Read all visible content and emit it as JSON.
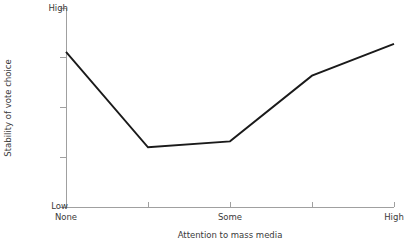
{
  "chart_data": {
    "type": "line",
    "title": "",
    "xlabel": "Attention to mass media",
    "ylabel": "Stability of vote choice",
    "x_tick_labels": [
      "None",
      "",
      "Some",
      "",
      "High"
    ],
    "y_tick_labels": [
      "Low",
      "",
      "",
      "",
      "High"
    ],
    "x_axis_low_label": "None",
    "x_axis_mid_label": "Some",
    "x_axis_high_label": "High",
    "y_axis_low_label": "Low",
    "y_axis_high_label": "High",
    "x_tick_count": 5,
    "y_tick_count": 5,
    "grid": false,
    "legend": null,
    "xlim": [
      0,
      4
    ],
    "ylim": [
      0,
      1
    ],
    "x": [
      0,
      1,
      2,
      3,
      4
    ],
    "values": [
      0.78,
      0.3,
      0.33,
      0.66,
      0.82
    ],
    "series": [
      {
        "name": "Stability of vote choice",
        "color": "#1a1a1a",
        "values": [
          0.78,
          0.3,
          0.33,
          0.66,
          0.82
        ]
      }
    ],
    "points_px": [
      {
        "x": 66,
        "y": 52
      },
      {
        "x": 148,
        "y": 148
      },
      {
        "x": 230,
        "y": 141
      },
      {
        "x": 312,
        "y": 76
      },
      {
        "x": 394,
        "y": 44
      }
    ],
    "polyline_points": "66,52 148,148 230,141 312,76 394,44",
    "axis_color": "#a0a0a0",
    "line_color": "#1a1a1a",
    "background_color": "#ffffff",
    "text_color": "#3a3a3a"
  }
}
